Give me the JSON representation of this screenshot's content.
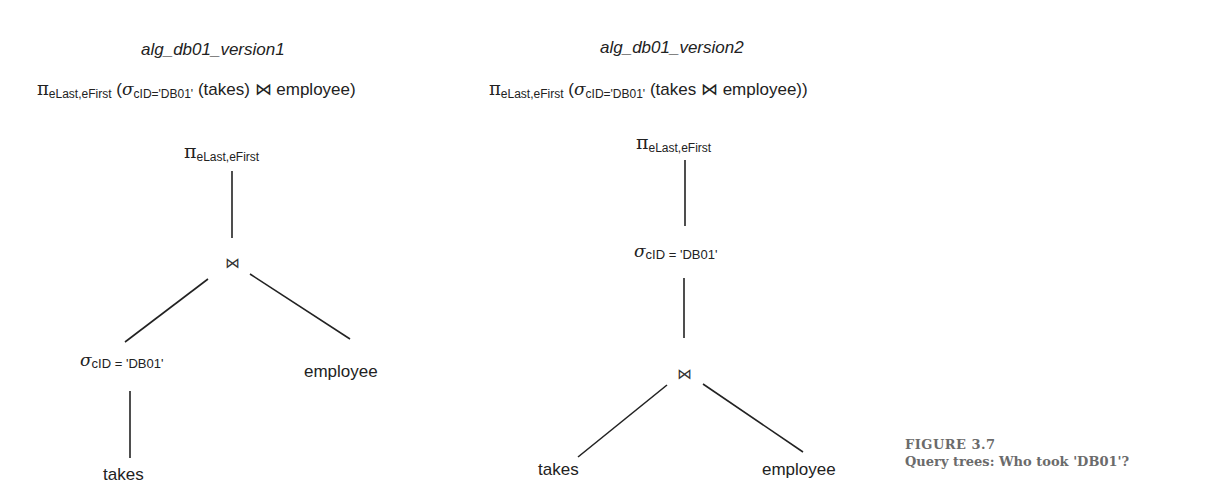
{
  "figure": {
    "number": "FIGURE 3.7",
    "caption": "Query trees: Who took 'DB01'?"
  },
  "symbols": {
    "project": "π",
    "select": "σ",
    "join": "⋈"
  },
  "trees": [
    {
      "title": "alg_db01_version1",
      "expression": {
        "project_sub": "eLast,eFirst",
        "open": " (",
        "select_sub": "cID='DB01'",
        "rest_a": " (takes) ",
        "join": "⋈",
        "rest_b": " employee)"
      },
      "nodes": {
        "root_sub": "eLast,eFirst",
        "select_sub": "cID = 'DB01'",
        "leaf_left": "takes",
        "leaf_right": "employee"
      }
    },
    {
      "title": "alg_db01_version2",
      "expression": {
        "project_sub": "eLast,eFirst",
        "open": " (",
        "select_sub": "cID='DB01'",
        "rest_a": " (takes ",
        "join": "⋈",
        "rest_b": " employee))"
      },
      "nodes": {
        "root_sub": "eLast,eFirst",
        "select_sub": "cID = 'DB01'",
        "leaf_left": "takes",
        "leaf_right": "employee"
      }
    }
  ]
}
